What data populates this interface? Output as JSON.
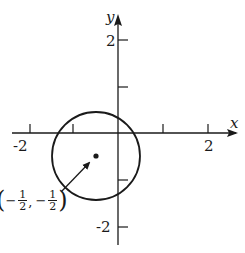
{
  "diagram": {
    "type": "coordinate-plane-circle",
    "axes": {
      "x_label": "x",
      "y_label": "y",
      "x_tick_labels": [
        "-2",
        "2"
      ],
      "y_tick_labels": [
        "2",
        "-2"
      ],
      "x_ticks": [
        -2,
        -1,
        1,
        2
      ],
      "y_ticks": [
        2,
        1,
        -1,
        -2
      ]
    },
    "circle": {
      "center": [
        -0.5,
        -0.5
      ],
      "radius": 1
    },
    "annotation": {
      "point_label": {
        "open": "(",
        "minus1": "−",
        "num1": "1",
        "den1": "2",
        "comma": ",",
        "minus2": "−",
        "num2": "1",
        "den2": "2",
        "close": ")"
      },
      "description": "center point"
    },
    "colors": {
      "stroke": "#1a1a1a",
      "background": "#ffffff"
    }
  }
}
